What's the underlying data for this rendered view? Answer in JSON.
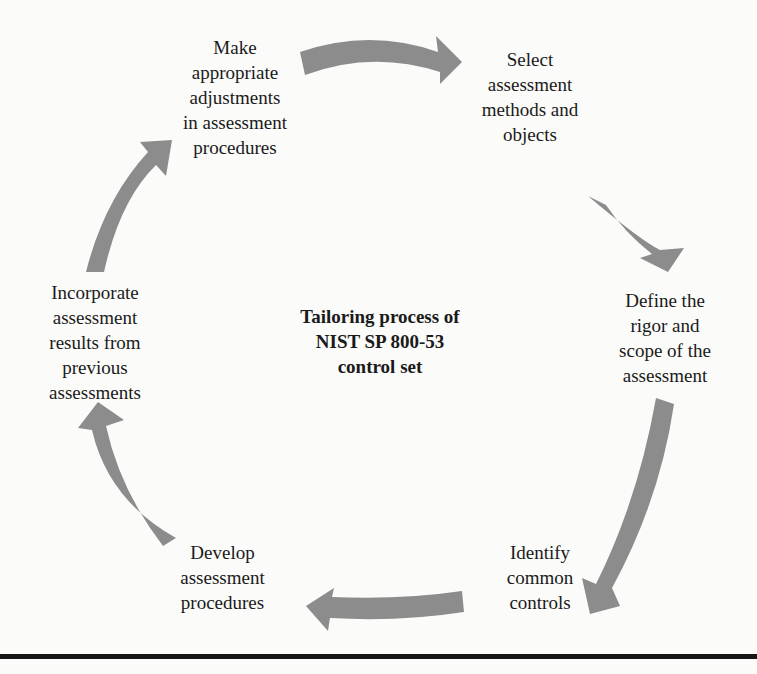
{
  "diagram": {
    "title": "Tailoring process of\nNIST SP 800-53\ncontrol set",
    "arrow_color": "#8c8c8c",
    "steps": [
      {
        "id": "select",
        "label": "Select\nassessment\nmethods and\nobjects"
      },
      {
        "id": "define",
        "label": "Define the\nrigor and\nscope of the\nassessment"
      },
      {
        "id": "identify",
        "label": "Identify\ncommon\ncontrols"
      },
      {
        "id": "develop",
        "label": "Develop\nassessment\nprocedures"
      },
      {
        "id": "incorporate",
        "label": "Incorporate\nassessment\nresults from\nprevious\nassessments"
      },
      {
        "id": "adjust",
        "label": "Make\nappropriate\nadjustments\nin assessment\nprocedures"
      }
    ],
    "flow": "clockwise"
  }
}
